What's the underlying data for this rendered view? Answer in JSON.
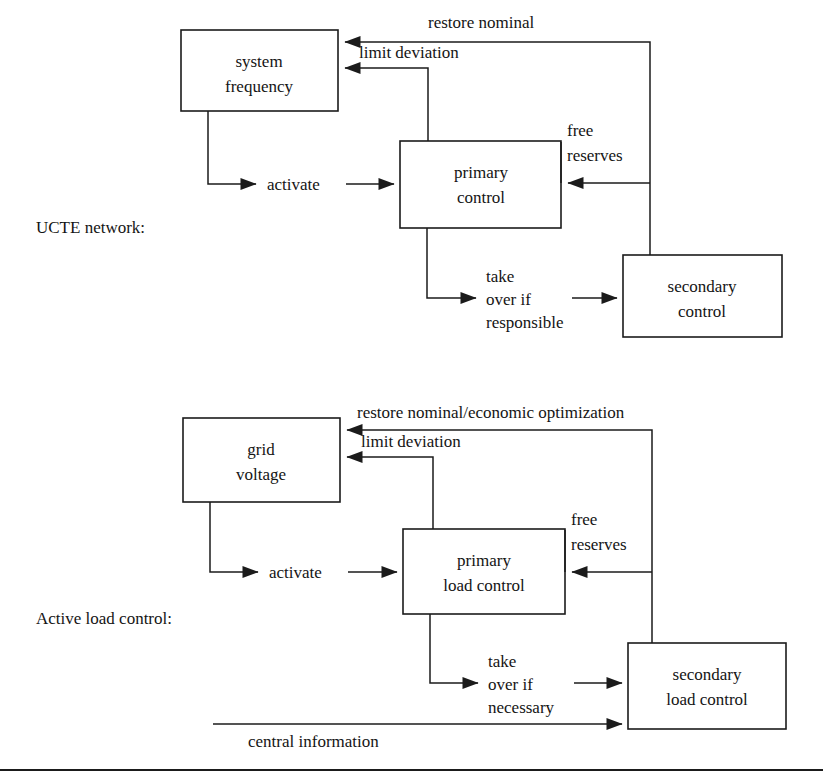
{
  "figure": {
    "type": "block-diagram",
    "background": "#ffffff",
    "line_color": "#1b1b1b",
    "text_color": "#141414"
  },
  "sections": [
    {
      "id": "ucte",
      "label": "UCTE network:",
      "boxes": [
        {
          "id": "system-frequency",
          "lines": [
            "system",
            "frequency"
          ]
        },
        {
          "id": "primary-control",
          "lines": [
            "primary",
            "control"
          ]
        },
        {
          "id": "secondary-control",
          "lines": [
            "secondary",
            "control"
          ]
        }
      ],
      "edge_labels": [
        {
          "id": "restore-nominal",
          "text": "restore nominal"
        },
        {
          "id": "limit-deviation",
          "text": "limit deviation"
        },
        {
          "id": "free-reserves",
          "lines": [
            "free",
            "reserves"
          ]
        },
        {
          "id": "activate",
          "text": "activate"
        },
        {
          "id": "take-over-if-responsible",
          "lines": [
            "take",
            "over if",
            "responsible"
          ]
        }
      ]
    },
    {
      "id": "active-load-control",
      "label": "Active load control:",
      "boxes": [
        {
          "id": "grid-voltage",
          "lines": [
            "grid",
            "voltage"
          ]
        },
        {
          "id": "primary-load-control",
          "lines": [
            "primary",
            "load control"
          ]
        },
        {
          "id": "secondary-load-control",
          "lines": [
            "secondary",
            "load control"
          ]
        }
      ],
      "edge_labels": [
        {
          "id": "restore-nominal-economic",
          "text": "restore nominal/economic optimization"
        },
        {
          "id": "limit-deviation",
          "text": "limit deviation"
        },
        {
          "id": "free-reserves",
          "lines": [
            "free",
            "reserves"
          ]
        },
        {
          "id": "activate",
          "text": "activate"
        },
        {
          "id": "take-over-if-necessary",
          "lines": [
            "take",
            "over if",
            "necessary"
          ]
        },
        {
          "id": "central-information",
          "text": "central information"
        }
      ]
    }
  ],
  "top": {
    "section_label": "UCTE network:",
    "box1_line1": "system",
    "box1_line2": "frequency",
    "box2_line1": "primary",
    "box2_line2": "control",
    "box3_line1": "secondary",
    "box3_line2": "control",
    "restore_nominal": "restore nominal",
    "limit_deviation": "limit deviation",
    "free": "free",
    "reserves": "reserves",
    "activate": "activate",
    "take": "take",
    "over_if": "over if",
    "responsible": "responsible"
  },
  "bottom": {
    "section_label": "Active load control:",
    "box1_line1": "grid",
    "box1_line2": "voltage",
    "box2_line1": "primary",
    "box2_line2": "load control",
    "box3_line1": "secondary",
    "box3_line2": "load control",
    "restore_nominal": "restore nominal/economic optimization",
    "limit_deviation": "limit deviation",
    "free": "free",
    "reserves": "reserves",
    "activate": "activate",
    "take": "take",
    "over_if": "over if",
    "necessary": "necessary",
    "central_information": "central information"
  }
}
